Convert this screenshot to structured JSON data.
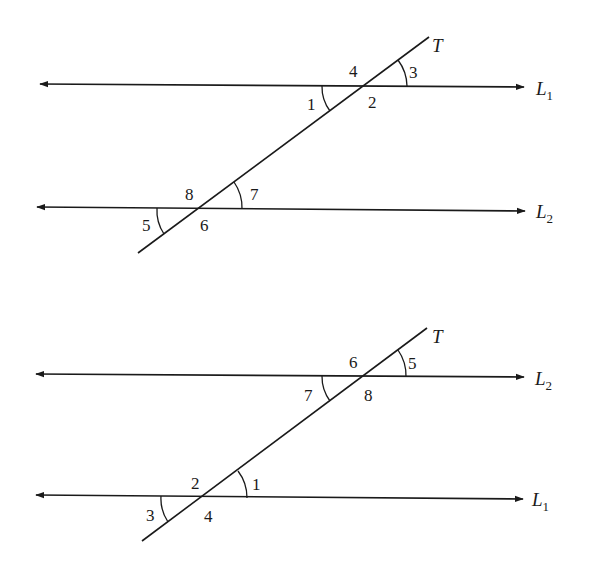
{
  "figures": [
    {
      "name": "top-figure",
      "transversal_label": "T",
      "upper_line": {
        "label": "L",
        "subscript": "1"
      },
      "lower_line": {
        "label": "L",
        "subscript": "2"
      },
      "angles": {
        "upper_above_left": "4",
        "upper_above_right": "3",
        "upper_below_left": "1",
        "upper_below_right": "2",
        "lower_above_left": "8",
        "lower_above_right": "7",
        "lower_below_left": "5",
        "lower_below_right": "6"
      }
    },
    {
      "name": "bottom-figure",
      "transversal_label": "T",
      "upper_line": {
        "label": "L",
        "subscript": "2"
      },
      "lower_line": {
        "label": "L",
        "subscript": "1"
      },
      "angles": {
        "upper_above_left": "6",
        "upper_above_right": "5",
        "upper_below_left": "7",
        "upper_below_right": "8",
        "lower_above_left": "2",
        "lower_above_right": "1",
        "lower_below_left": "3",
        "lower_below_right": "4"
      }
    }
  ],
  "colors": {
    "stroke": "#1a1a1a",
    "background": "#ffffff"
  }
}
